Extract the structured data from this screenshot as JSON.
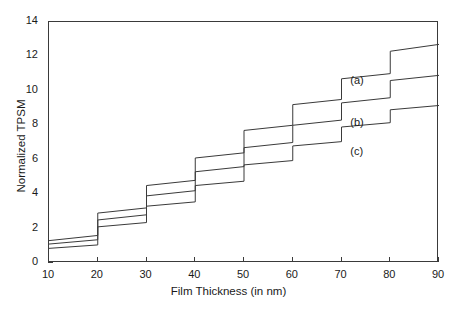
{
  "chart_data": {
    "type": "line",
    "title": "",
    "xlabel": "Film Thickness (in nm)",
    "ylabel": "Normalized TPSM",
    "xlim": [
      10,
      90
    ],
    "ylim": [
      0,
      14
    ],
    "xticks": [
      10,
      20,
      30,
      40,
      50,
      60,
      70,
      80,
      90
    ],
    "yticks": [
      0,
      2,
      4,
      6,
      8,
      10,
      12,
      14
    ],
    "grid": false,
    "legend_position": "inline-annotations",
    "frame": "box",
    "annotations": [
      {
        "label": "(a)",
        "x": 72,
        "y": 10.5,
        "series": "a"
      },
      {
        "label": "(b)",
        "x": 72,
        "y": 8.1,
        "series": "b"
      },
      {
        "label": "(c)",
        "x": 72,
        "y": 6.4,
        "series": "c"
      }
    ],
    "series": [
      {
        "name": "(a)",
        "label": "(a)",
        "color": "#3a3a3a",
        "x": [
          10,
          20,
          20,
          30,
          30,
          40,
          40,
          50,
          50,
          60,
          60,
          70,
          70,
          80,
          80,
          90
        ],
        "values": [
          1.3,
          1.6,
          2.9,
          3.2,
          4.5,
          4.8,
          6.1,
          6.4,
          7.7,
          8.0,
          9.2,
          9.5,
          10.7,
          11.0,
          12.3,
          12.7
        ]
      },
      {
        "name": "(b)",
        "label": "(b)",
        "color": "#3a3a3a",
        "x": [
          10,
          20,
          20,
          30,
          30,
          40,
          40,
          50,
          50,
          60,
          60,
          70,
          70,
          80,
          80,
          90
        ],
        "values": [
          1.1,
          1.35,
          2.5,
          2.8,
          3.9,
          4.2,
          5.3,
          5.6,
          6.7,
          7.0,
          8.0,
          8.3,
          9.3,
          9.6,
          10.6,
          10.9
        ]
      },
      {
        "name": "(c)",
        "label": "(c)",
        "color": "#3a3a3a",
        "x": [
          10,
          20,
          20,
          30,
          30,
          40,
          40,
          50,
          50,
          60,
          60,
          70,
          70,
          80,
          80,
          90
        ],
        "values": [
          0.85,
          1.05,
          2.1,
          2.35,
          3.3,
          3.55,
          4.5,
          4.75,
          5.7,
          5.95,
          6.8,
          7.05,
          7.9,
          8.15,
          8.9,
          9.15
        ]
      }
    ]
  }
}
